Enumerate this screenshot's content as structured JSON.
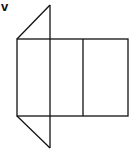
{
  "diagram": {
    "label": "v",
    "stroke_color": "#111111"
  }
}
